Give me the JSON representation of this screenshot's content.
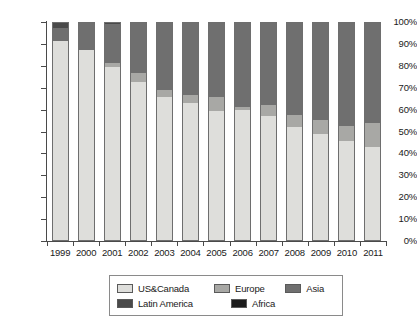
{
  "chart_data": {
    "type": "bar",
    "subtype": "stacked-percentage",
    "title": "",
    "xlabel": "",
    "ylabel": "",
    "ylim": [
      0,
      100
    ],
    "ytick_labels": [
      "100%",
      "90%",
      "80%",
      "70%",
      "60%",
      "50%",
      "40%",
      "30%",
      "20%",
      "10%",
      "0%"
    ],
    "ytick_values": [
      100,
      90,
      80,
      70,
      60,
      50,
      40,
      30,
      20,
      10,
      0
    ],
    "grid": false,
    "legend_position": "bottom",
    "categories": [
      "1999",
      "2000",
      "2001",
      "2002",
      "2003",
      "2004",
      "2005",
      "2006",
      "2007",
      "2008",
      "2009",
      "2010",
      "2011"
    ],
    "series": [
      {
        "name": "US&Canada",
        "color": "#dededb",
        "values": [
          91.5,
          87.5,
          79.5,
          73.0,
          66.0,
          63.0,
          59.5,
          60.0,
          57.0,
          52.0,
          49.0,
          45.5,
          43.0
        ]
      },
      {
        "name": "Europe",
        "color": "#a8a8a5",
        "values": [
          0.0,
          0.0,
          2.0,
          4.0,
          3.0,
          4.0,
          6.5,
          1.5,
          5.0,
          5.5,
          6.5,
          7.0,
          11.0
        ]
      },
      {
        "name": "Asia",
        "color": "#6f6f6f",
        "values": [
          6.0,
          12.5,
          18.0,
          23.0,
          31.0,
          33.0,
          34.0,
          38.5,
          38.0,
          42.5,
          44.5,
          47.5,
          46.0
        ]
      },
      {
        "name": "Latin America",
        "color": "#4a4a4a",
        "values": [
          2.5,
          0.0,
          0.5,
          0.0,
          0.0,
          0.0,
          0.0,
          0.0,
          0.0,
          0.0,
          0.0,
          0.0,
          0.0
        ]
      },
      {
        "name": "Africa",
        "color": "#1c1c1c",
        "values": [
          0.0,
          0.0,
          0.0,
          0.0,
          0.0,
          0.0,
          0.0,
          0.0,
          0.0,
          0.0,
          0.0,
          0.0,
          0.0
        ]
      }
    ]
  },
  "legend": {
    "rows": [
      [
        {
          "label": "US&Canada",
          "color": "#dededb",
          "icon": "legend-swatch"
        },
        {
          "label": "Europe",
          "color": "#a8a8a5",
          "icon": "legend-swatch"
        },
        {
          "label": "Asia",
          "color": "#6f6f6f",
          "icon": "legend-swatch"
        }
      ],
      [
        {
          "label": "Latin America",
          "color": "#4a4a4a",
          "icon": "legend-swatch"
        },
        {
          "label": "Africa",
          "color": "#1c1c1c",
          "icon": "legend-swatch"
        }
      ]
    ]
  }
}
